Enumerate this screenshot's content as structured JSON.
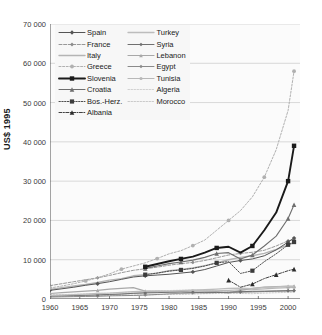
{
  "chart": {
    "type": "line",
    "title": "",
    "xlabel": "",
    "ylabel": "US$ 1995",
    "xlim": [
      1960,
      2002
    ],
    "ylim": [
      0,
      70000
    ],
    "grid": "horizontal",
    "legend_position": "top-left inside",
    "yticks": [
      "0",
      "10 000",
      "20 000",
      "30 000",
      "40 000",
      "50 000",
      "60 000",
      "70 000"
    ],
    "ytick_values": [
      0,
      10000,
      20000,
      30000,
      40000,
      50000,
      60000,
      70000
    ],
    "xticks": [
      "1960",
      "1965",
      "1970",
      "1975",
      "1980",
      "1985",
      "1990",
      "1995",
      "2000"
    ],
    "xtick_values": [
      1960,
      1965,
      1970,
      1975,
      1980,
      1985,
      1990,
      1995,
      2000
    ]
  },
  "legend": {
    "column_left": [
      {
        "label": "Spain",
        "key": "spain"
      },
      {
        "label": "France",
        "key": "france"
      },
      {
        "label": "Italy",
        "key": "italy"
      },
      {
        "label": "Greece",
        "key": "greece"
      },
      {
        "label": "Slovenia",
        "key": "slovenia"
      },
      {
        "label": "Croatia",
        "key": "croatia"
      },
      {
        "label": "Bos.-Herz.",
        "key": "bosherz"
      },
      {
        "label": "Albania",
        "key": "albania"
      }
    ],
    "column_right": [
      {
        "label": "Turkey",
        "key": "turkey"
      },
      {
        "label": "Syria",
        "key": "syria"
      },
      {
        "label": "Lebanon",
        "key": "lebanon"
      },
      {
        "label": "Egypt",
        "key": "egypt"
      },
      {
        "label": "Tunisia",
        "key": "tunisia"
      },
      {
        "label": "Algeria",
        "key": "algeria"
      },
      {
        "label": "Morocco",
        "key": "morocco"
      }
    ]
  },
  "colors": {
    "axis": "#4d4d4d",
    "grid": "#c8c8c8",
    "text": "#1a1a1a",
    "spain": "#555555",
    "france": "#8c8c8c",
    "italy": "#b4b4b4",
    "greece": "#b0b0b0",
    "slovenia": "#1a1a1a",
    "croatia": "#6e6e6e",
    "bosherz": "#3c3c3c",
    "albania": "#2b2b2b",
    "turkey": "#bdbdbd",
    "syria": "#707070",
    "lebanon": "#a8a8a8",
    "egypt": "#8a8a8a",
    "tunisia": "#b8b8b8",
    "algeria": "#cccccc",
    "morocco": "#c4c4c4"
  },
  "chart_data": {
    "type": "line",
    "title": "",
    "xlabel": "",
    "ylabel": "US$ 1995",
    "xlim": [
      1960,
      2002
    ],
    "ylim": [
      0,
      70000
    ],
    "grid": true,
    "legend": [
      "Spain",
      "France",
      "Italy",
      "Greece",
      "Slovenia",
      "Croatia",
      "Bos.-Herz.",
      "Albania",
      "Turkey",
      "Syria",
      "Lebanon",
      "Egypt",
      "Tunisia",
      "Algeria",
      "Morocco"
    ],
    "x": [
      1960,
      1962,
      1964,
      1966,
      1968,
      1970,
      1972,
      1974,
      1976,
      1978,
      1980,
      1982,
      1984,
      1986,
      1988,
      1990,
      1992,
      1994,
      1996,
      1998,
      2000,
      2001
    ],
    "series": [
      {
        "name": "Spain",
        "style": "solid-marker",
        "values": [
          2200,
          2600,
          3000,
          3500,
          3900,
          4400,
          5000,
          5600,
          5900,
          6100,
          6300,
          6600,
          6900,
          7500,
          8400,
          9300,
          9800,
          10200,
          11000,
          12500,
          14500,
          15500
        ]
      },
      {
        "name": "France",
        "style": "dashed-marker",
        "values": [
          3400,
          3900,
          4400,
          4900,
          5400,
          6000,
          6700,
          7300,
          7700,
          8100,
          8600,
          9000,
          9300,
          9800,
          10500,
          11200,
          11600,
          11900,
          12400,
          13500,
          14800,
          15200
        ]
      },
      {
        "name": "Italy",
        "style": "solid-light",
        "values": [
          2400,
          2900,
          3300,
          3700,
          4200,
          4800,
          5200,
          5900,
          6200,
          6600,
          7200,
          7500,
          7900,
          8500,
          9200,
          10000,
          10600,
          11000,
          11600,
          12600,
          13800,
          14300
        ]
      },
      {
        "name": "Greece",
        "style": "dotted-marker",
        "values": [
          2800,
          3300,
          3900,
          4600,
          5400,
          6400,
          7600,
          8400,
          9200,
          10300,
          11500,
          12300,
          13600,
          15000,
          17500,
          20000,
          22500,
          26000,
          31000,
          38000,
          48000,
          58000
        ]
      },
      {
        "name": "Slovenia",
        "style": "thick-solid-marker",
        "values": [
          null,
          null,
          null,
          null,
          null,
          null,
          null,
          null,
          8200,
          8900,
          9600,
          10200,
          10800,
          11800,
          13000,
          13300,
          11800,
          13500,
          17500,
          22000,
          30000,
          39000
        ]
      },
      {
        "name": "Croatia",
        "style": "solid-marker-tri",
        "values": [
          null,
          null,
          null,
          null,
          null,
          null,
          null,
          null,
          7800,
          8400,
          9000,
          9400,
          9900,
          10600,
          11600,
          11800,
          10200,
          11200,
          13500,
          16000,
          20500,
          24000
        ]
      },
      {
        "name": "Bos.-Herz.",
        "style": "dotted-square",
        "values": [
          null,
          null,
          null,
          null,
          null,
          null,
          null,
          null,
          6200,
          6600,
          7100,
          7400,
          7800,
          8400,
          9200,
          9500,
          6500,
          7200,
          9500,
          11500,
          13800,
          14500
        ]
      },
      {
        "name": "Albania",
        "style": "dashdot-marker",
        "values": [
          null,
          null,
          null,
          null,
          null,
          null,
          null,
          null,
          null,
          null,
          null,
          null,
          null,
          null,
          null,
          4800,
          3000,
          3800,
          5200,
          6200,
          7200,
          7600
        ]
      },
      {
        "name": "Turkey",
        "style": "light-solid",
        "values": [
          900,
          1000,
          1100,
          1250,
          1400,
          1500,
          1700,
          1900,
          2000,
          2050,
          2000,
          2100,
          2250,
          2350,
          2500,
          2700,
          2750,
          2650,
          2950,
          3100,
          3250,
          3100
        ]
      },
      {
        "name": "Syria",
        "style": "light-marker",
        "values": [
          800,
          850,
          900,
          950,
          1050,
          1150,
          1250,
          1450,
          1550,
          1600,
          1750,
          1800,
          1700,
          1600,
          1650,
          1700,
          1850,
          1950,
          2000,
          2050,
          2100,
          2100
        ]
      },
      {
        "name": "Lebanon",
        "style": "light-solid-2",
        "values": [
          1400,
          1600,
          1800,
          2000,
          2200,
          2500,
          2700,
          2900,
          2000,
          1800,
          1600,
          1500,
          1700,
          1800,
          1900,
          1500,
          2200,
          2700,
          3000,
          3150,
          3250,
          3300
        ]
      },
      {
        "name": "Egypt",
        "style": "mid-marker",
        "values": [
          500,
          550,
          600,
          650,
          700,
          800,
          850,
          900,
          1000,
          1150,
          1300,
          1450,
          1550,
          1600,
          1650,
          1700,
          1750,
          1800,
          1900,
          2000,
          2100,
          2150
        ]
      },
      {
        "name": "Tunisia",
        "style": "light-solid-3",
        "values": [
          700,
          780,
          860,
          950,
          1050,
          1150,
          1300,
          1450,
          1600,
          1750,
          1900,
          1950,
          2050,
          2050,
          2100,
          2200,
          2350,
          2400,
          2600,
          2750,
          2900,
          2950
        ]
      },
      {
        "name": "Algeria",
        "style": "faint-dotted",
        "values": [
          1100,
          1150,
          1200,
          1300,
          1400,
          1500,
          1650,
          1800,
          1950,
          2050,
          2150,
          2250,
          2300,
          2200,
          2050,
          1950,
          1850,
          1800,
          1850,
          1900,
          1950,
          1980
        ]
      },
      {
        "name": "Morocco",
        "style": "faint-dotted-2",
        "values": [
          600,
          650,
          700,
          760,
          820,
          880,
          950,
          1000,
          1050,
          1100,
          1180,
          1150,
          1250,
          1350,
          1400,
          1450,
          1400,
          1350,
          1500,
          1600,
          1700,
          1720
        ]
      }
    ]
  }
}
